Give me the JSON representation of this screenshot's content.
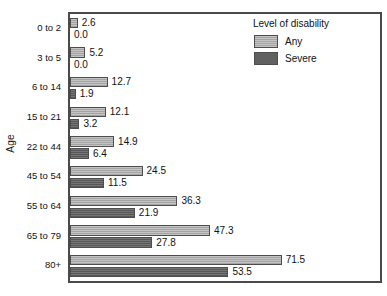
{
  "chart_data": {
    "type": "bar",
    "orientation": "horizontal",
    "title": "",
    "xlabel": "",
    "ylabel": "Age",
    "categories": [
      "0 to 2",
      "3 to 5",
      "6 to 14",
      "15 to 21",
      "22 to 44",
      "45 to 54",
      "55 to 64",
      "65 to 79",
      "80+"
    ],
    "series": [
      {
        "name": "Any",
        "color": "#ababab",
        "values": [
          2.6,
          5.2,
          12.7,
          12.1,
          14.9,
          24.5,
          36.3,
          47.3,
          71.5
        ]
      },
      {
        "name": "Severe",
        "color": "#616161",
        "values": [
          0.0,
          0.0,
          1.9,
          3.2,
          6.4,
          11.5,
          21.9,
          27.8,
          53.5
        ]
      }
    ],
    "value_labels": [
      [
        "2.6",
        "0.0"
      ],
      [
        "5.2",
        "0.0"
      ],
      [
        "12.7",
        "1.9"
      ],
      [
        "12.1",
        "3.2"
      ],
      [
        "14.9",
        "6.4"
      ],
      [
        "24.5",
        "11.5"
      ],
      [
        "36.3",
        "21.9"
      ],
      [
        "47.3",
        "27.8"
      ],
      [
        "71.5",
        "53.5"
      ]
    ],
    "xlim": [
      0,
      104.7
    ],
    "grid": false,
    "legend": {
      "title": "Level of disability",
      "position": "top-right",
      "entries": [
        "Any",
        "Severe"
      ]
    }
  },
  "legend": {
    "title": "Level of disability",
    "items": [
      {
        "label": "Any",
        "color": "#ababab"
      },
      {
        "label": "Severe",
        "color": "#616161"
      }
    ]
  },
  "axis": {
    "y_title": "Age"
  }
}
